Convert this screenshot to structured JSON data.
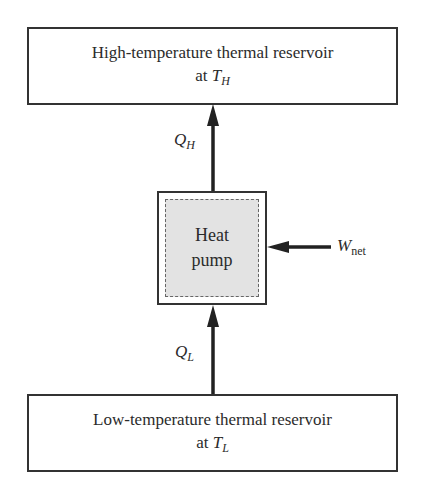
{
  "diagram": {
    "high_reservoir": {
      "line1": "High-temperature thermal reservoir",
      "line2_prefix": "at ",
      "temp_symbol": "T",
      "temp_subscript": "H"
    },
    "low_reservoir": {
      "line1": "Low-temperature thermal reservoir",
      "line2_prefix": "at ",
      "temp_symbol": "T",
      "temp_subscript": "L"
    },
    "heat_pump": {
      "line1": "Heat",
      "line2": "pump"
    },
    "flows": {
      "q_high": {
        "symbol": "Q",
        "subscript": "H",
        "direction": "up"
      },
      "q_low": {
        "symbol": "Q",
        "subscript": "L",
        "direction": "up"
      },
      "work": {
        "symbol": "W",
        "subscript": "net",
        "direction": "left"
      }
    },
    "colors": {
      "stroke": "#333333",
      "pump_fill": "#e3e3e3",
      "background": "#ffffff"
    }
  }
}
